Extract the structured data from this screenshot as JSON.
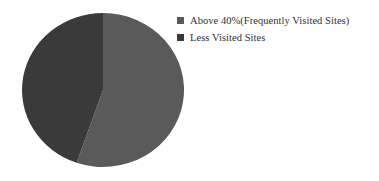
{
  "chart_data": {
    "type": "pie",
    "title": "",
    "subtitle": "",
    "xlabel": "",
    "ylabel": "",
    "grid": false,
    "legend_position": "right-top",
    "categories": [
      "Above 40%(Frequently Visited Sites)",
      "Less Visited Sites"
    ],
    "values": [
      55,
      45
    ],
    "slices": [
      {
        "label": "Above 40%(Frequently Visited Sites)",
        "value": 55,
        "color": "#5a5a5a",
        "start_angle_deg": 0,
        "end_angle_deg": 199
      },
      {
        "label": "Less Visited Sites",
        "value": 45,
        "color": "#3a3a3a",
        "start_angle_deg": 199,
        "end_angle_deg": 360
      }
    ],
    "annotations": []
  },
  "legend": {
    "items": [
      {
        "label": "Above 40%(Frequently Visited Sites)",
        "color": "#5a5a5a",
        "marker": "square-marker"
      },
      {
        "label": "Less Visited Sites",
        "color": "#3a3a3a",
        "marker": "square-marker"
      }
    ]
  },
  "colors": {
    "background": "#ffffff",
    "text": "#2f2f2f",
    "slice_major": "#5a5a5a",
    "slice_minor": "#3a3a3a"
  },
  "geometry": {
    "center_x": 103,
    "center_y": 90,
    "radius_x": 81,
    "radius_y": 77
  }
}
